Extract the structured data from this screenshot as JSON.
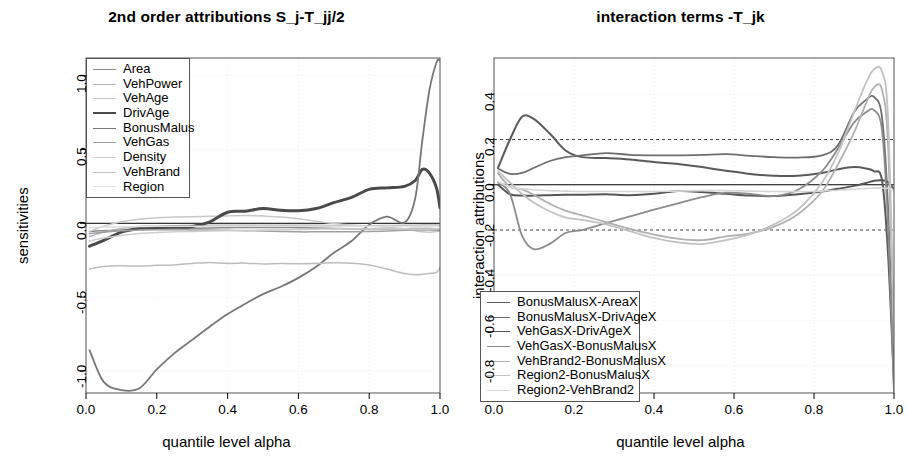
{
  "figure": {
    "width": 907,
    "height": 468,
    "background": "#ffffff"
  },
  "chart_data": [
    {
      "type": "line",
      "panel": "left",
      "title": "2nd order attributions S_j-T_jj/2",
      "xlabel": "quantile level alpha",
      "ylabel": "sensitivities",
      "xlim": [
        0.0,
        1.0
      ],
      "ylim": [
        -1.15,
        1.12
      ],
      "xticks": [
        "0.0",
        "0.2",
        "0.4",
        "0.6",
        "0.8",
        "1.0"
      ],
      "xtick_values": [
        0.0,
        0.2,
        0.4,
        0.6,
        0.8,
        1.0
      ],
      "yticks": [
        "1.0",
        "0.5",
        "0.0",
        "-0.5",
        "-1.0"
      ],
      "ytick_values": [
        1.0,
        0.5,
        0.0,
        -0.5,
        -1.0
      ],
      "grid": "faint dotted vertical and horizontal",
      "zero_line": true,
      "legend_position": "top-left",
      "legend_entries": [
        "Area",
        "VehPower",
        "VehAge",
        "DrivAge",
        "BonusMalus",
        "VehGas",
        "Density",
        "VehBrand",
        "Region"
      ],
      "x": [
        0.01,
        0.05,
        0.1,
        0.15,
        0.2,
        0.25,
        0.3,
        0.35,
        0.4,
        0.45,
        0.5,
        0.55,
        0.6,
        0.65,
        0.7,
        0.75,
        0.8,
        0.85,
        0.9,
        0.93,
        0.95,
        0.97,
        0.99,
        1.0
      ],
      "series": [
        {
          "name": "Area",
          "color": "#8a8a8a",
          "width": 1.5,
          "values": [
            -0.055,
            -0.05,
            -0.045,
            -0.042,
            -0.04,
            -0.038,
            -0.035,
            -0.032,
            -0.03,
            -0.028,
            -0.028,
            -0.028,
            -0.03,
            -0.032,
            -0.035,
            -0.038,
            -0.04,
            -0.04,
            -0.038,
            -0.035,
            -0.035,
            -0.035,
            -0.038,
            -0.04
          ]
        },
        {
          "name": "VehPower",
          "color": "#b5b5b5",
          "width": 1.5,
          "values": [
            -0.09,
            -0.06,
            -0.035,
            -0.022,
            -0.018,
            -0.016,
            -0.015,
            -0.014,
            -0.014,
            -0.014,
            -0.014,
            -0.014,
            -0.014,
            -0.014,
            -0.015,
            -0.016,
            -0.016,
            -0.015,
            -0.014,
            -0.013,
            -0.012,
            -0.012,
            -0.012,
            -0.012
          ]
        },
        {
          "name": "VehAge",
          "color": "#c8c8c8",
          "width": 1.5,
          "values": [
            -0.055,
            -0.02,
            0.01,
            0.028,
            0.038,
            0.042,
            0.045,
            0.047,
            0.05,
            0.052,
            0.05,
            0.042,
            0.03,
            0.014,
            -0.002,
            -0.012,
            -0.02,
            -0.028,
            -0.038,
            -0.05,
            -0.058,
            -0.06,
            -0.056,
            -0.05
          ]
        },
        {
          "name": "DrivAge",
          "color": "#4a4a4a",
          "width": 3.0,
          "values": [
            -0.155,
            -0.115,
            -0.06,
            -0.035,
            -0.028,
            -0.026,
            -0.022,
            0.01,
            0.075,
            0.082,
            0.1,
            0.088,
            0.085,
            0.1,
            0.14,
            0.175,
            0.23,
            0.24,
            0.25,
            0.29,
            0.365,
            0.34,
            0.24,
            0.105
          ]
        },
        {
          "name": "BonusMalus",
          "color": "#777777",
          "width": 1.8,
          "values": [
            -0.86,
            -1.075,
            -1.13,
            -1.12,
            -0.99,
            -0.88,
            -0.79,
            -0.7,
            -0.615,
            -0.545,
            -0.48,
            -0.43,
            -0.37,
            -0.295,
            -0.2,
            -0.12,
            -0.01,
            0.045,
            0.005,
            0.17,
            0.56,
            0.9,
            1.09,
            1.105
          ]
        },
        {
          "name": "VehGas",
          "color": "#9f9f9f",
          "width": 1.5,
          "values": [
            -0.07,
            -0.06,
            -0.05,
            -0.046,
            -0.044,
            -0.044,
            -0.045,
            -0.046,
            -0.048,
            -0.05,
            -0.052,
            -0.055,
            -0.058,
            -0.058,
            -0.058,
            -0.058,
            -0.056,
            -0.052,
            -0.048,
            -0.046,
            -0.046,
            -0.046,
            -0.048,
            -0.05
          ]
        },
        {
          "name": "Density",
          "color": "#cfcfcf",
          "width": 1.5,
          "values": [
            -0.12,
            -0.1,
            -0.082,
            -0.07,
            -0.062,
            -0.058,
            -0.055,
            -0.052,
            -0.05,
            -0.048,
            -0.046,
            -0.044,
            -0.042,
            -0.04,
            -0.038,
            -0.038,
            -0.038,
            -0.038,
            -0.038,
            -0.038,
            -0.038,
            -0.038,
            -0.038,
            -0.038
          ]
        },
        {
          "name": "VehBrand",
          "color": "#bdbdbd",
          "width": 1.5,
          "values": [
            -0.31,
            -0.292,
            -0.288,
            -0.29,
            -0.285,
            -0.282,
            -0.272,
            -0.265,
            -0.272,
            -0.27,
            -0.276,
            -0.272,
            -0.275,
            -0.272,
            -0.268,
            -0.27,
            -0.282,
            -0.31,
            -0.34,
            -0.348,
            -0.345,
            -0.34,
            -0.332,
            -0.3
          ]
        },
        {
          "name": "Region",
          "color": "#e0e0e0",
          "width": 1.5,
          "values": [
            -0.03,
            -0.026,
            -0.024,
            -0.022,
            -0.02,
            -0.02,
            -0.02,
            -0.02,
            -0.02,
            -0.02,
            -0.02,
            -0.02,
            -0.02,
            -0.02,
            -0.02,
            -0.02,
            -0.02,
            -0.02,
            -0.02,
            -0.02,
            -0.02,
            -0.02,
            -0.02,
            -0.02
          ]
        }
      ]
    },
    {
      "type": "line",
      "panel": "right",
      "title": "interaction terms -T_jk",
      "xlabel": "quantile level alpha",
      "ylabel": "interaction attributions",
      "xlim": [
        0.0,
        1.0
      ],
      "ylim": [
        -0.92,
        0.56
      ],
      "xticks": [
        "0.0",
        "0.2",
        "0.4",
        "0.6",
        "0.8",
        "1.0"
      ],
      "xtick_values": [
        0.0,
        0.2,
        0.4,
        0.6,
        0.8,
        1.0
      ],
      "yticks": [
        "0.4",
        "0.2",
        "0.0",
        "-0.2",
        "-0.4",
        "-0.6",
        "-0.8"
      ],
      "ytick_values": [
        0.4,
        0.2,
        0.0,
        -0.2,
        -0.4,
        -0.6,
        -0.8
      ],
      "grid": "faint dotted vertical; dashed horizontal at +0.2 and -0.2",
      "hlines_dashed": [
        0.2,
        -0.2
      ],
      "zero_line": true,
      "legend_position": "bottom-left",
      "legend_entries": [
        "BonusMalusX-AreaX",
        "BonusMalusX-DrivAgeX",
        "VehGasX-DrivAgeX",
        "VehGasX-BonusMalusX",
        "VehBrand2-BonusMalusX",
        "Region2-BonusMalusX",
        "Region2-VehBrand2"
      ],
      "x": [
        0.01,
        0.04,
        0.07,
        0.1,
        0.14,
        0.18,
        0.22,
        0.28,
        0.34,
        0.4,
        0.46,
        0.52,
        0.58,
        0.64,
        0.7,
        0.76,
        0.82,
        0.86,
        0.9,
        0.93,
        0.95,
        0.97,
        0.985,
        1.0
      ],
      "series": [
        {
          "name": "BonusMalusX-AreaX",
          "color": "#5a5a5a",
          "width": 2.0,
          "values": [
            0.075,
            0.2,
            0.3,
            0.29,
            0.225,
            0.15,
            0.122,
            0.118,
            0.112,
            0.1,
            0.092,
            0.078,
            0.062,
            0.048,
            0.04,
            0.04,
            0.052,
            0.068,
            0.078,
            0.072,
            0.06,
            0.02,
            -0.3,
            -0.88
          ]
        },
        {
          "name": "BonusMalusX-DrivAgeX",
          "color": "#6e6e6e",
          "width": 1.8,
          "values": [
            0.072,
            0.048,
            0.052,
            0.075,
            0.105,
            0.122,
            0.13,
            0.14,
            0.132,
            0.13,
            0.13,
            0.132,
            0.135,
            0.128,
            0.122,
            0.12,
            0.13,
            0.175,
            0.32,
            0.375,
            0.388,
            0.3,
            -0.1,
            -0.86
          ]
        },
        {
          "name": "VehGasX-DrivAgeX",
          "color": "#555555",
          "width": 2.0,
          "values": [
            0.0,
            -0.042,
            -0.048,
            -0.048,
            -0.046,
            -0.044,
            -0.044,
            -0.042,
            -0.046,
            -0.04,
            -0.028,
            -0.032,
            -0.04,
            -0.048,
            -0.05,
            -0.042,
            -0.03,
            -0.018,
            -0.005,
            0.008,
            0.018,
            0.02,
            0.012,
            -0.02
          ]
        },
        {
          "name": "VehGasX-BonusMalusX",
          "color": "#8c8c8c",
          "width": 1.8,
          "values": [
            0.01,
            -0.04,
            -0.225,
            -0.285,
            -0.26,
            -0.212,
            -0.2,
            -0.17,
            -0.14,
            -0.11,
            -0.082,
            -0.055,
            -0.035,
            -0.04,
            -0.05,
            -0.022,
            0.06,
            0.16,
            0.275,
            0.32,
            0.33,
            0.24,
            -0.18,
            -0.92
          ]
        },
        {
          "name": "VehBrand2-BonusMalusX",
          "color": "#b0b0b0",
          "width": 1.8,
          "values": [
            0.05,
            -0.01,
            -0.02,
            -0.045,
            -0.085,
            -0.115,
            -0.135,
            -0.165,
            -0.195,
            -0.22,
            -0.238,
            -0.245,
            -0.228,
            -0.215,
            -0.185,
            -0.13,
            -0.03,
            0.09,
            0.23,
            0.36,
            0.43,
            0.42,
            0.18,
            -0.7
          ]
        },
        {
          "name": "Region2-BonusMalusX",
          "color": "#c2c2c2",
          "width": 1.8,
          "values": [
            0.06,
            0.01,
            -0.04,
            -0.08,
            -0.118,
            -0.145,
            -0.155,
            -0.175,
            -0.205,
            -0.235,
            -0.255,
            -0.262,
            -0.245,
            -0.218,
            -0.175,
            -0.11,
            0.01,
            0.14,
            0.32,
            0.45,
            0.51,
            0.5,
            0.3,
            -0.62
          ]
        },
        {
          "name": "Region2-VehBrand2",
          "color": "#d6d6d6",
          "width": 1.6,
          "values": [
            0.012,
            -0.01,
            -0.018,
            -0.022,
            -0.026,
            -0.028,
            -0.03,
            -0.03,
            -0.03,
            -0.03,
            -0.028,
            -0.026,
            -0.026,
            -0.028,
            -0.03,
            -0.03,
            -0.028,
            -0.024,
            -0.02,
            -0.016,
            -0.014,
            -0.014,
            -0.016,
            -0.022
          ]
        }
      ]
    }
  ]
}
